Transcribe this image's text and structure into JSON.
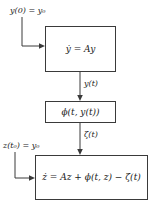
{
  "diagram": {
    "stroke_color": "#3a3a3a",
    "text_color": "#1a1a1a",
    "background": "#ffffff",
    "blocks": [
      {
        "id": "plant",
        "label": "ẏ = Ay"
      },
      {
        "id": "nonlinearity",
        "label": "ϕ(t, y(t))"
      },
      {
        "id": "perturbed",
        "label": "ż = Az + ϕ(t, z) − ζ(t)"
      }
    ],
    "edge_labels": [
      {
        "id": "state-output",
        "label": "y(t)"
      },
      {
        "id": "zeta-output",
        "label": "ζ(t)"
      }
    ],
    "inputs": [
      {
        "id": "initial-condition-y",
        "label": "y(0) = y₀"
      },
      {
        "id": "initial-condition-z",
        "label": "z(t₀) = y₀"
      }
    ]
  }
}
